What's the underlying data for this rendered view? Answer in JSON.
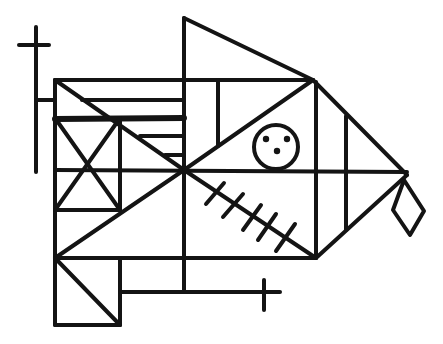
{
  "figure": {
    "title": "",
    "colors": {
      "background": "#ffffff",
      "ink": "#141414"
    },
    "stroke_width": 4,
    "elements": {
      "left_cross": {
        "description": "vertical staff with crossbar at top-left"
      },
      "body_grid": {
        "description": "rectangular grid body with diagonals and X-braced box"
      },
      "head_triangle": {
        "description": "large triangle forming the upper fin"
      },
      "eye": {
        "description": "circle with three dots",
        "dots": 3
      },
      "hatched_diagonal": {
        "description": "diagonal with tick marks",
        "ticks": 5
      },
      "tail_diamond": {
        "description": "diamond hanging from the nose tip"
      },
      "bottom_cross": {
        "description": "small cross at end of lower horizontal bar"
      }
    }
  }
}
